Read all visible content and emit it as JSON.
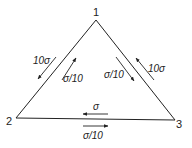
{
  "diagram": {
    "type": "triangle-network",
    "nodes": [
      {
        "id": "1",
        "label": "1",
        "x": 96,
        "y": 20,
        "label_x": 93,
        "label_y": 16
      },
      {
        "id": "2",
        "label": "2",
        "x": 16,
        "y": 118,
        "label_x": 6,
        "label_y": 125
      },
      {
        "id": "3",
        "label": "3",
        "x": 175,
        "y": 120,
        "label_x": 176,
        "label_y": 128
      }
    ],
    "edges": [
      {
        "from": "1",
        "to": "2"
      },
      {
        "from": "1",
        "to": "3"
      },
      {
        "from": "2",
        "to": "3"
      }
    ],
    "arrows": [
      {
        "edge": "1-2",
        "side": "outer",
        "label": "10σ",
        "direction": "2→... toward node 2",
        "x1": 56,
        "y1": 57,
        "x2": 38,
        "y2": 79,
        "label_x": 33,
        "label_y": 64
      },
      {
        "edge": "1-2",
        "side": "inner",
        "label": "σ/10",
        "direction": "toward node 1",
        "x1": 62,
        "y1": 80,
        "x2": 76,
        "y2": 58,
        "label_x": 63,
        "label_y": 82
      },
      {
        "edge": "1-3",
        "side": "inner",
        "label": "σ/10",
        "direction": "toward node 3",
        "x1": 116,
        "y1": 57,
        "x2": 134,
        "y2": 81,
        "label_x": 104,
        "label_y": 78
      },
      {
        "edge": "1-3",
        "side": "outer",
        "label": "10σ",
        "direction": "toward node 1",
        "x1": 154,
        "y1": 80,
        "x2": 136,
        "y2": 58,
        "label_x": 148,
        "label_y": 72
      },
      {
        "edge": "2-3",
        "side": "above",
        "label": "σ",
        "direction": "toward node 2",
        "x1": 108,
        "y1": 114,
        "x2": 83,
        "y2": 114,
        "label_x": 93,
        "label_y": 110
      },
      {
        "edge": "2-3",
        "side": "below",
        "label": "σ/10",
        "direction": "toward node 3",
        "x1": 83,
        "y1": 126,
        "x2": 108,
        "y2": 126,
        "label_x": 83,
        "label_y": 139
      }
    ]
  }
}
